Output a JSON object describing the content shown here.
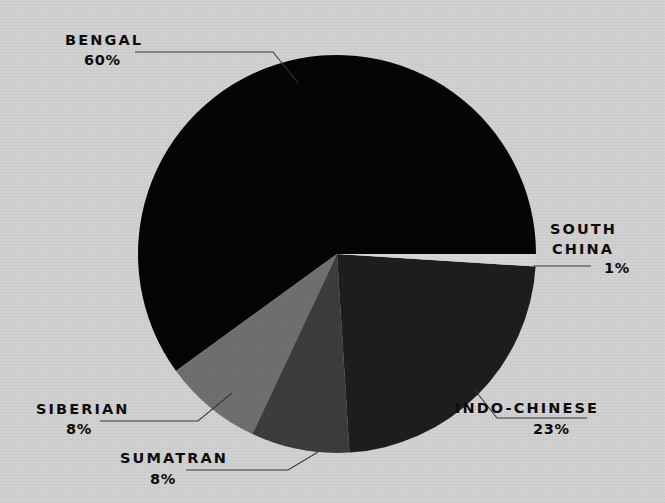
{
  "chart_data": {
    "type": "pie",
    "title": "",
    "subtitle": "",
    "xlabel": "",
    "ylabel": "",
    "legend_position": "none",
    "grid": false,
    "categories": [
      "BENGAL",
      "SOUTH CHINA",
      "INDO-CHINESE",
      "SUMATRAN",
      "SIBERIAN"
    ],
    "values": [
      60,
      1,
      23,
      8,
      8
    ],
    "unit": "%",
    "slices": [
      {
        "label": "BENGAL",
        "value": 60,
        "value_text": "60%",
        "color": "#050505",
        "start_angle_deg": 0,
        "end_angle_deg": 216
      },
      {
        "label": "SOUTH CHINA",
        "value": 1,
        "value_text": "1%",
        "color": "#d8d8d8",
        "start_angle_deg": 356.4,
        "end_angle_deg": 360
      },
      {
        "label": "INDO-CHINESE",
        "value": 23,
        "value_text": "23%",
        "color": "#1e1e1e",
        "start_angle_deg": 273.6,
        "end_angle_deg": 356.4
      },
      {
        "label": "SUMATRAN",
        "value": 8,
        "value_text": "8%",
        "color": "#3d3d3d",
        "start_angle_deg": 244.8,
        "end_angle_deg": 273.6
      },
      {
        "label": "SIBERIAN",
        "value": 8,
        "value_text": "8%",
        "color": "#707070",
        "start_angle_deg": 216,
        "end_angle_deg": 244.8
      }
    ]
  },
  "labels": {
    "bengal": {
      "name": "BENGAL",
      "value": "60%"
    },
    "south_china": {
      "name_line1": "SOUTH",
      "name_line2": "CHINA",
      "value": "1%"
    },
    "indo_chinese": {
      "name": "INDO-CHINESE",
      "value": "23%"
    },
    "sumatran": {
      "name": "SUMATRAN",
      "value": "8%"
    },
    "siberian": {
      "name": "SIBERIAN",
      "value": "8%"
    }
  },
  "colors": {
    "background": "#d2d2d2",
    "bengal": "#050505",
    "south_china": "#d8d8d8",
    "indo_chinese": "#1e1e1e",
    "sumatran": "#3d3d3d",
    "siberian": "#707070",
    "leader_line": "#3a3a3a",
    "text": "#0d0d0d"
  }
}
